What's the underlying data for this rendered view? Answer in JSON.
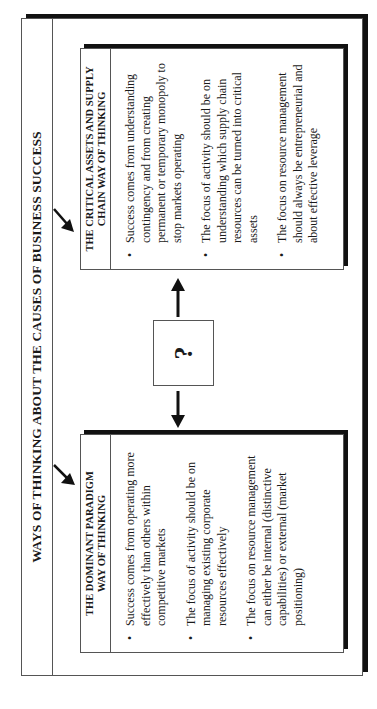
{
  "title": "WAYS OF THINKING ABOUT THE CAUSES OF BUSINESS SUCCESS",
  "center_box": {
    "label": "?"
  },
  "left_box": {
    "header_line1": "THE DOMINANT PARADIGM",
    "header_line2": "WAY OF THINKING",
    "bullets": [
      "Success comes from operating more effectively than others within competitive markets",
      "The focus of activity should be on managing existing corporate resources effectively",
      "The focus on resource management can either be internal (distinctive capabilities) or external (market positioning)"
    ]
  },
  "right_box": {
    "header_line1": "THE CRITICAL ASSETS AND SUPPLY",
    "header_line2": "CHAIN WAY OF THINKING",
    "bullets": [
      "Success comes from understanding contingency and from creating permanent or temporary monopoly to stop markets operating",
      "The focus of activity should be on understanding which supply chain resources can be turned into critical assets",
      "The focus on resource management should always be entrepreneurial and about effective leverage"
    ]
  },
  "bullet_glyph": "•",
  "colors": {
    "border": "#555555",
    "shadow": "#111111",
    "background": "#ffffff",
    "text": "#1a1a1a"
  }
}
